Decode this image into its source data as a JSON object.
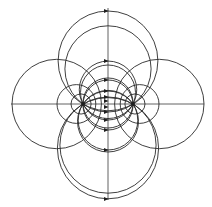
{
  "diagram": {
    "title": "",
    "colors": {
      "stroke": "#2a2a2a",
      "background": "#ffffff"
    },
    "charges": [
      {
        "name": "left-charge",
        "x": 83,
        "y": 104
      },
      {
        "name": "right-charge",
        "x": 133,
        "y": 104
      }
    ],
    "axes": {
      "horizontal": {
        "x1": 11,
        "x2": 204,
        "y": 104
      },
      "vertical": {
        "x": 108,
        "y1": 8,
        "y2": 200
      }
    },
    "field_line_circles": [
      {
        "cx": 108,
        "cy": 60.9,
        "r": 49.9
      },
      {
        "cx": 108,
        "cy": 89.8,
        "r": 28.75
      },
      {
        "cx": 108,
        "cy": 105.0,
        "r": 25.02
      },
      {
        "cx": 108,
        "cy": 121.5,
        "r": 30.5
      },
      {
        "cx": 108,
        "cy": 145.1,
        "r": 48.1
      },
      {
        "cx": 108,
        "cy": 68.9,
        "r": 43.1
      },
      {
        "cx": 108,
        "cy": 92.5,
        "r": 27.5
      },
      {
        "cx": 108,
        "cy": 103.0,
        "r": 25.02
      },
      {
        "cx": 108,
        "cy": 120.2,
        "r": 29.8
      },
      {
        "cx": 108,
        "cy": 148.2,
        "r": 50.6
      }
    ],
    "equipotential_circles": [
      {
        "cx": 56.7,
        "cy": 104,
        "r": 44.7
      },
      {
        "cx": 76.4,
        "cy": 104,
        "r": 19.4
      },
      {
        "cx": 81.05,
        "cy": 104,
        "r": 10.05
      },
      {
        "cx": 159.3,
        "cy": 104,
        "r": 44.7
      },
      {
        "cx": 139.6,
        "cy": 104,
        "r": 19.4
      },
      {
        "cx": 134.95,
        "cy": 104,
        "r": 10.05
      }
    ],
    "arrows": [
      {
        "x": 106,
        "y": 11
      },
      {
        "x": 106,
        "y": 61
      },
      {
        "x": 106,
        "y": 80
      },
      {
        "x": 106,
        "y": 91
      },
      {
        "x": 106,
        "y": 97
      },
      {
        "x": 106,
        "y": 101
      },
      {
        "x": 106,
        "y": 107
      },
      {
        "x": 106,
        "y": 112
      },
      {
        "x": 106,
        "y": 120
      },
      {
        "x": 106,
        "y": 130
      },
      {
        "x": 106,
        "y": 150
      },
      {
        "x": 106,
        "y": 199
      }
    ],
    "arrow_direction": "right"
  }
}
